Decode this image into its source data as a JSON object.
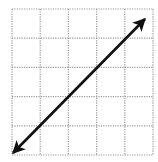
{
  "diagram": {
    "type": "coordinate-grid-with-line",
    "grid": {
      "columns": 5,
      "rows": 5,
      "line_style": "dotted",
      "line_color": "#9a9a9a",
      "x_lines": [
        12,
        40.2,
        68.4,
        96.6,
        124.8,
        153
      ],
      "y_lines": [
        9,
        38.2,
        67.4,
        96.6,
        125.8,
        155
      ]
    },
    "line": {
      "description": "Double-headed arrow line with positive slope running from bottom-left corner to near top-right",
      "color": "#111111",
      "start": {
        "x": 13,
        "y": 153
      },
      "end": {
        "x": 145,
        "y": 19
      },
      "arrowheads": "both"
    }
  }
}
